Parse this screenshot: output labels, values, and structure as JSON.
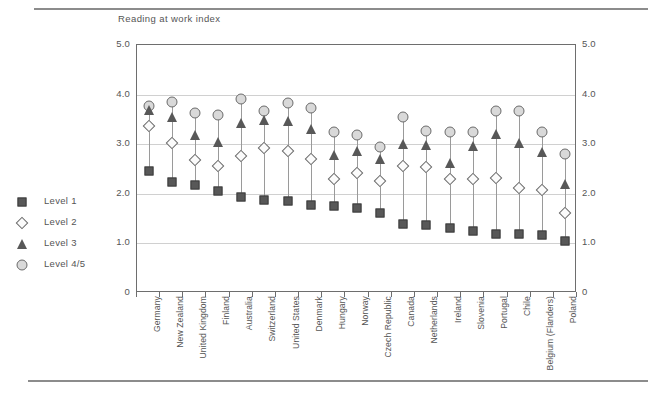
{
  "chart_data": {
    "type": "scatter",
    "title": "Reading at work index",
    "xlabel": "",
    "ylabel": "",
    "ylim": [
      0,
      5
    ],
    "yticks": [
      "0",
      "1.0",
      "2.0",
      "3.0",
      "4.0",
      "5.0"
    ],
    "grid": true,
    "legend_position": "left-outside",
    "dual_y_axis": true,
    "categories": [
      "Germany",
      "New Zealand",
      "United Kingdom",
      "Finland",
      "Australia",
      "Switzerland",
      "United States",
      "Denmark",
      "Hungary",
      "Norway",
      "Czech Republic",
      "Canada",
      "Netherlands",
      "Ireland",
      "Slovenia",
      "Portugal",
      "Chile",
      "Belgium (Flanders)",
      "Poland"
    ],
    "series": [
      {
        "name": "Level 1",
        "marker": "filled-square",
        "color": "#585858",
        "values": [
          2.46,
          2.24,
          2.17,
          2.05,
          1.93,
          1.87,
          1.85,
          1.78,
          1.76,
          1.71,
          1.62,
          1.4,
          1.38,
          1.32,
          1.25,
          1.19,
          1.18,
          1.17,
          1.04
        ]
      },
      {
        "name": "Level 2",
        "marker": "open-diamond",
        "color": "#fbfbfb",
        "values": [
          3.37,
          3.03,
          2.69,
          2.56,
          2.77,
          2.93,
          2.87,
          2.71,
          2.3,
          2.41,
          2.25,
          2.57,
          2.55,
          2.3,
          2.3,
          2.32,
          2.11,
          2.08,
          1.62
        ]
      },
      {
        "name": "Level 3",
        "marker": "filled-triangle",
        "color": "#585858",
        "values": [
          3.7,
          3.57,
          3.2,
          3.06,
          3.44,
          3.5,
          3.48,
          3.33,
          2.8,
          2.88,
          2.72,
          3.02,
          3.0,
          2.64,
          2.98,
          3.22,
          3.04,
          2.86,
          2.22
        ]
      },
      {
        "name": "Level 4/5",
        "marker": "light-circle",
        "color": "#d9d9d9",
        "values": [
          3.78,
          3.85,
          3.62,
          3.58,
          3.92,
          3.66,
          3.83,
          3.73,
          3.25,
          3.19,
          2.95,
          3.55,
          3.27,
          3.24,
          3.25,
          3.66,
          3.66,
          3.25,
          2.8
        ]
      }
    ]
  }
}
